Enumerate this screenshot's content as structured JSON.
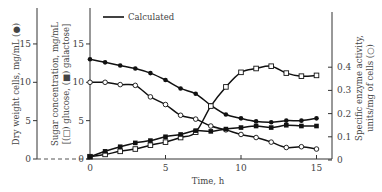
{
  "chart_data": {
    "type": "line",
    "title": "",
    "legend": {
      "entries": [
        {
          "label": "Calculated",
          "style": "solid-line"
        }
      ],
      "placement": "top-left"
    },
    "xlabel": "Time, h",
    "x_ticks": [
      "0",
      "5",
      "10",
      "15"
    ],
    "xlim": [
      0,
      16
    ],
    "axes": {
      "left_outer": {
        "label": "Dry weight cells, mg/mL (●)",
        "ticks": [
          "0",
          "5",
          "10",
          "15"
        ],
        "ylim": [
          0,
          19
        ]
      },
      "left_inner": {
        "label": "Sugar concentration, mg/mL [(□) glucose, (■) galactose]",
        "ticks": [
          "0",
          "5",
          "10",
          "15"
        ],
        "ylim": [
          0,
          19
        ]
      },
      "right": {
        "label": "Specific enzyme activity, units/mg of cells (○)",
        "ticks": [
          "0",
          "0.1",
          "0.2",
          "0.3",
          "0.4"
        ],
        "ylim": [
          0,
          0.63
        ]
      }
    },
    "series": [
      {
        "name": "filled-circle-declining",
        "marker": "filled-circle",
        "axis": "left_inner",
        "x": [
          0,
          1,
          2,
          3,
          4,
          5,
          6,
          7,
          8,
          9,
          10,
          11,
          12,
          13,
          14,
          15
        ],
        "y": [
          13.0,
          12.6,
          12.2,
          11.8,
          11.2,
          10.3,
          9.2,
          8.5,
          7.0,
          5.8,
          5.3,
          4.9,
          4.8,
          5.0,
          5.0,
          5.3
        ]
      },
      {
        "name": "open-circle-declining",
        "marker": "open-circle",
        "axis": "left_inner",
        "x": [
          0,
          1,
          2,
          3,
          4,
          5,
          6,
          7,
          8,
          9,
          10,
          11,
          12,
          13,
          14,
          15
        ],
        "y": [
          10.0,
          10.0,
          9.7,
          9.6,
          8.1,
          7.1,
          5.7,
          5.2,
          4.3,
          3.8,
          3.2,
          2.8,
          2.2,
          1.5,
          1.6,
          1.3
        ]
      },
      {
        "name": "open-square-rising",
        "marker": "open-square",
        "axis": "left_inner",
        "x": [
          0,
          1,
          2,
          3,
          4,
          5,
          6,
          7,
          8,
          9,
          10,
          11,
          12,
          13,
          14,
          15
        ],
        "y": [
          0.3,
          0.6,
          1.0,
          1.3,
          1.8,
          2.2,
          2.8,
          3.5,
          6.9,
          9.4,
          11.3,
          11.8,
          12.1,
          11.2,
          10.8,
          10.9
        ]
      },
      {
        "name": "filled-square-rising",
        "marker": "filled-square",
        "axis": "left_inner",
        "x": [
          0,
          1,
          2,
          3,
          4,
          5,
          6,
          7,
          8,
          9,
          10,
          11,
          12,
          13,
          14,
          15
        ],
        "y": [
          0.3,
          1.0,
          1.6,
          2.1,
          2.4,
          2.9,
          3.2,
          3.7,
          3.6,
          3.9,
          4.1,
          4.3,
          4.1,
          4.4,
          4.3,
          4.3
        ]
      }
    ]
  }
}
